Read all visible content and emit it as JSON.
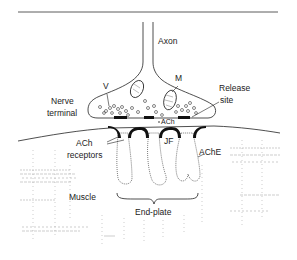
{
  "diagram": {
    "type": "anatomical-schematic",
    "labels": {
      "axon": "Axon",
      "mitochondrion": "M",
      "vesicle": "V",
      "release_site_line1": "Release",
      "release_site_line2": "site",
      "nerve_terminal_line1": "Nerve",
      "nerve_terminal_line2": "terminal",
      "ach": "ACh",
      "ach_receptors_line1": "ACh",
      "ach_receptors_line2": "receptors",
      "junctional_fold": "JF",
      "ache": "AChE",
      "muscle": "Muscle",
      "end_plate": "End-plate"
    },
    "colors": {
      "ink": "#222222",
      "receptor": "#111111",
      "stipple": "#9a9a9a",
      "background": "#ffffff"
    }
  }
}
